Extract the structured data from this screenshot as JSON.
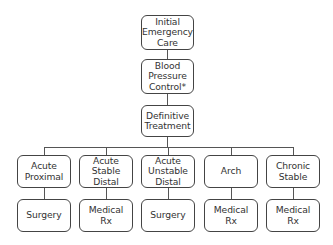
{
  "diagram": {
    "type": "flowchart",
    "top": [
      {
        "id": "initial",
        "label": "Initial\nEmergency\nCare"
      },
      {
        "id": "bp",
        "label": "Blood\nPressure\nControl*"
      },
      {
        "id": "definitive",
        "label": "Definitive\nTreatment"
      }
    ],
    "categories": [
      {
        "id": "acute-proximal",
        "label": "Acute\nProximal",
        "treatment": "Surgery"
      },
      {
        "id": "acute-stable-distal",
        "label": "Acute\nStable\nDistal",
        "treatment": "Medical\nRx"
      },
      {
        "id": "acute-unstable-distal",
        "label": "Acute\nUnstable\nDistal",
        "treatment": "Surgery"
      },
      {
        "id": "arch",
        "label": "Arch",
        "treatment": "Medical\nRx"
      },
      {
        "id": "chronic-stable",
        "label": "Chronic\nStable",
        "treatment": "Medical\nRx"
      }
    ],
    "edges": [
      [
        "initial",
        "bp"
      ],
      [
        "bp",
        "definitive"
      ],
      [
        "definitive",
        "acute-proximal"
      ],
      [
        "definitive",
        "acute-stable-distal"
      ],
      [
        "definitive",
        "acute-unstable-distal"
      ],
      [
        "definitive",
        "arch"
      ],
      [
        "definitive",
        "chronic-stable"
      ],
      [
        "acute-proximal",
        "Surgery"
      ],
      [
        "acute-stable-distal",
        "Medical Rx"
      ],
      [
        "acute-unstable-distal",
        "Surgery"
      ],
      [
        "arch",
        "Medical Rx"
      ],
      [
        "chronic-stable",
        "Medical Rx"
      ]
    ]
  }
}
